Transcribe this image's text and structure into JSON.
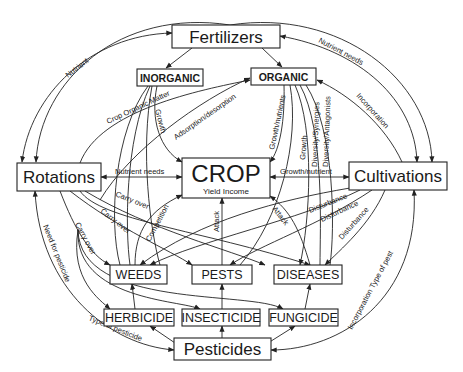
{
  "diagram": {
    "nodes": {
      "fertilizers": "Fertilizers",
      "inorganic": "INORGANIC",
      "organic": "ORGANIC",
      "rotations": "Rotations",
      "crop": "CROP",
      "crop_sub": "Yield Income",
      "cultivations": "Cultivations",
      "weeds": "WEEDS",
      "pests": "PESTS",
      "diseases": "DISEASES",
      "herbicide": "HERBICIDE",
      "insecticide": "INSECTICIDE",
      "fungicide": "FUNGICIDE",
      "pesticides": "Pesticides"
    },
    "edge_labels": {
      "nutrient": "Nutrient",
      "nutrient_needs_top": "Nutrient needs",
      "crop_organic_matter": "Crop Organic Matter",
      "growth_inorganic": "Growth",
      "adsorption": "Adsorption/desorption",
      "growth_nutrients": "Growth/nutrients",
      "growth_organic": "Growth",
      "diversity_synergies": "Diversity/Synergies",
      "diversity_antagonists": "Diversity/Antagonists",
      "incorporation_top": "Incorporation",
      "nutrient_needs_mid": "Nutrient needs",
      "growth_nutrient": "Growth/nutrient",
      "carry_over_1": "Carry over",
      "carry_over_2": "Carry over",
      "carry_over_3": "Carry over",
      "competition": "Competition",
      "attack_1": "Attack",
      "attack_2": "Attack",
      "disturbance_1": "Disturbance",
      "disturbance_2": "Disturbance",
      "disturbance_3": "Disturbance",
      "need_for_pesticide": "Need for pesticide",
      "type_of_pesticide": "Type of pesticide",
      "incorporation_type_of_pest": "Incorporation Type of pest"
    }
  }
}
